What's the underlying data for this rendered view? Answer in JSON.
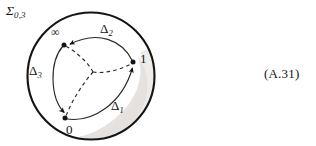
{
  "figure": {
    "caption_number": "(A.31)",
    "surface_label": "Σ",
    "surface_label_subscript": "0,3",
    "background_color": "#ffffff",
    "ink_color": "#141414",
    "shading_color": "#e8e6e4"
  },
  "boundary": {
    "name": "outer-circle",
    "center_x": 91,
    "center_y": 76,
    "radius": 64,
    "stroke_width": 2.1,
    "stroke_color": "#141414"
  },
  "marked_points": [
    {
      "id": "infinity",
      "label": "∞",
      "x": 64,
      "y": 45,
      "label_x": 51,
      "label_y": 26
    },
    {
      "id": "one",
      "label": "1",
      "x": 133,
      "y": 62,
      "label_x": 140,
      "label_y": 52
    },
    {
      "id": "zero",
      "label": "0",
      "x": 65,
      "y": 118,
      "label_x": 66,
      "label_y": 123
    }
  ],
  "center_point": {
    "id": "basepoint",
    "x": 93,
    "y": 72
  },
  "loops": [
    {
      "id": "delta1",
      "label": "Δ",
      "subscript": "1",
      "label_x": 111,
      "label_y": 99,
      "from": "zero",
      "to": "one",
      "style": "solid",
      "arrow_at": "one"
    },
    {
      "id": "delta2",
      "label": "Δ",
      "subscript": "2",
      "label_x": 100,
      "label_y": 22,
      "from": "one",
      "to": "infinity",
      "style": "solid",
      "arrow_at": "infinity"
    },
    {
      "id": "delta3",
      "label": "Δ",
      "subscript": "3",
      "label_x": 29,
      "label_y": 64,
      "from": "infinity",
      "to": "zero",
      "style": "solid",
      "arrow_at": "zero"
    }
  ],
  "dashed_spokes": [
    {
      "id": "spoke-to-infinity",
      "to": "infinity"
    },
    {
      "id": "spoke-to-one",
      "to": "one"
    },
    {
      "id": "spoke-to-zero",
      "to": "zero"
    }
  ]
}
